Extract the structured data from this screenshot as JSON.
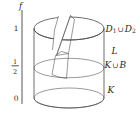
{
  "axis": {
    "label": "f",
    "ticks": {
      "top": "1",
      "mid_num": "1",
      "mid_den": "2",
      "bottom": "0"
    }
  },
  "regions": {
    "top_disks": {
      "first": "D",
      "first_sub": "1",
      "cup": "∪",
      "second": "D",
      "second_sub": "2"
    },
    "lateral": "L",
    "middle": {
      "first": "K",
      "cup": "∪",
      "second": "B"
    },
    "bottom": "K"
  },
  "colors": {
    "background": "#ffffff",
    "body": "#d7d7d7",
    "top_face": "#b4b4b4",
    "inner_wall_light": "#c9c9c9",
    "cut_face_dark": "#8d8d8d",
    "gap": "#ffffff",
    "text": "#2b2b2b"
  }
}
